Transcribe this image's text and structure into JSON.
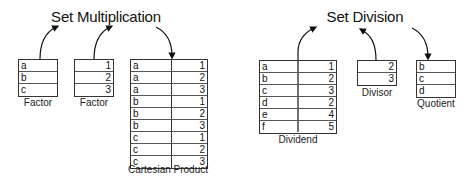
{
  "multiplication": {
    "title": "Set Multiplication",
    "factor1": {
      "label": "Factor",
      "rows": [
        "a",
        "b",
        "c"
      ]
    },
    "factor2": {
      "label": "Factor",
      "rows": [
        "1",
        "2",
        "3"
      ]
    },
    "product": {
      "label": "Cartesian Product",
      "rows": [
        [
          "a",
          "1"
        ],
        [
          "a",
          "2"
        ],
        [
          "a",
          "3"
        ],
        [
          "b",
          "1"
        ],
        [
          "b",
          "2"
        ],
        [
          "b",
          "3"
        ],
        [
          "c",
          "1"
        ],
        [
          "c",
          "2"
        ],
        [
          "c",
          "3"
        ]
      ]
    }
  },
  "division": {
    "title": "Set Division",
    "dividend": {
      "label": "Dividend",
      "rows": [
        [
          "a",
          "1"
        ],
        [
          "b",
          "2"
        ],
        [
          "c",
          "3"
        ],
        [
          "d",
          "2"
        ],
        [
          "e",
          "4"
        ],
        [
          "f",
          "5"
        ]
      ]
    },
    "divisor": {
      "label": "Divisor",
      "rows": [
        "2",
        "3"
      ]
    },
    "quotient": {
      "label": "Quotient",
      "rows": [
        "b",
        "c",
        "d"
      ]
    }
  },
  "colors": {
    "line": "#333333",
    "text": "#111111",
    "background": "#ffffff"
  }
}
